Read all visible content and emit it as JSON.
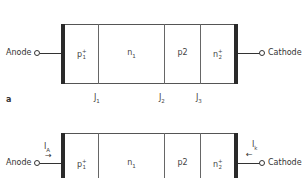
{
  "diagram_a": {
    "panel_label": "a",
    "anode_label": "Anode",
    "cathode_label": "Cathode",
    "regions": [
      {
        "base": "p",
        "sub": "1",
        "sup": "+"
      },
      {
        "base": "n",
        "sub": "1",
        "sup": ""
      },
      {
        "base": "p",
        "sub": "2",
        "sup": ""
      },
      {
        "base": "n",
        "sub": "2",
        "sup": "+"
      }
    ],
    "junctions": [
      {
        "base": "J",
        "sub": "1"
      },
      {
        "base": "J",
        "sub": "2"
      },
      {
        "base": "J",
        "sub": "3"
      }
    ]
  },
  "diagram_b": {
    "anode_label": "Anode",
    "cathode_label": "Cathode",
    "anode_current": {
      "base": "I",
      "sub": "A",
      "arrow": "→"
    },
    "cathode_current": {
      "base": "I",
      "sub": "k",
      "arrow": "←"
    },
    "regions": [
      {
        "base": "p",
        "sub": "1",
        "sup": "+"
      },
      {
        "base": "n",
        "sub": "1",
        "sup": ""
      },
      {
        "base": "p",
        "sub": "2",
        "sup": ""
      },
      {
        "base": "n",
        "sub": "2",
        "sup": "+"
      }
    ]
  }
}
